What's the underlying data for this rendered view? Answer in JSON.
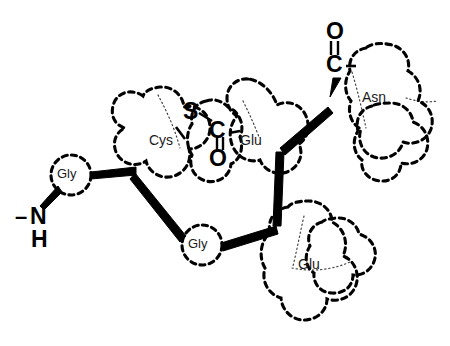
{
  "figure": {
    "kind": "chemical-structure-diagram",
    "background_color": "#ffffff",
    "ink_color": "#000000",
    "residue_outline_style": "dashed",
    "internal_partition_style": "dotted",
    "backbone_bond_style": "thick solid tapered"
  },
  "residues": [
    {
      "id": "gly-1",
      "label": "Gly",
      "shape": "circle",
      "label_x": 71,
      "label_y": 175,
      "font_size": 13
    },
    {
      "id": "cys",
      "label": "Cys",
      "shape": "lobed-envelope",
      "label_x": 168,
      "label_y": 142,
      "font_size": 13
    },
    {
      "id": "glu-upper",
      "label": "Glu",
      "shape": "lobed-envelope",
      "label_x": 254,
      "label_y": 142,
      "font_size": 13
    },
    {
      "id": "asn",
      "label": "Asn",
      "shape": "lobed-envelope",
      "label_x": 378,
      "label_y": 99,
      "font_size": 13
    },
    {
      "id": "gly-2",
      "label": "Gly",
      "shape": "circle",
      "label_x": 202,
      "label_y": 245,
      "font_size": 13
    },
    {
      "id": "glu-lower",
      "label": "Glu",
      "shape": "lobed-envelope",
      "label_x": 312,
      "label_y": 265,
      "font_size": 13
    }
  ],
  "atom_labels": [
    {
      "id": "n-terminus-n",
      "text": "N",
      "x": 36,
      "y": 218,
      "font_size": 22
    },
    {
      "id": "n-terminus-h",
      "text": "H",
      "x": 36,
      "y": 240,
      "font_size": 22
    },
    {
      "id": "n-terminus-dash",
      "text": "–",
      "x": 20,
      "y": 218,
      "font_size": 22
    },
    {
      "id": "cys-sulfur",
      "text": "S",
      "x": 188,
      "y": 113,
      "font_size": 22
    },
    {
      "id": "cys-carbonyl-c",
      "text": "C",
      "x": 214,
      "y": 131,
      "font_size": 22
    },
    {
      "id": "cys-carbonyl-o",
      "text": "O",
      "x": 214,
      "y": 158,
      "font_size": 22
    },
    {
      "id": "asn-carbonyl-o",
      "text": "O",
      "x": 331,
      "y": 33,
      "font_size": 22
    },
    {
      "id": "asn-carbonyl-c",
      "text": "C",
      "x": 331,
      "y": 64,
      "font_size": 22
    }
  ],
  "bond_marks": [
    {
      "id": "cys-c-o-double-bond",
      "type": "double",
      "orientation": "vertical"
    },
    {
      "id": "asn-c-o-double-bond",
      "type": "double",
      "orientation": "vertical"
    },
    {
      "id": "cys-s-to-c-bond",
      "type": "single",
      "orientation": "diagonal"
    },
    {
      "id": "cys-c-to-glu-bond",
      "type": "single",
      "orientation": "horizontal"
    },
    {
      "id": "asn-c-to-residue-bond",
      "type": "single",
      "orientation": "horizontal"
    },
    {
      "id": "cys-sidechain-stub",
      "type": "single",
      "orientation": "diagonal"
    }
  ],
  "backbone_bonds": [
    {
      "id": "bond-n-to-gly1",
      "from": "n-terminus",
      "to": "gly-1"
    },
    {
      "id": "bond-gly1-to-cys",
      "from": "gly-1",
      "to": "cys"
    },
    {
      "id": "bond-cys-to-gly2",
      "from": "cys",
      "to": "gly-2"
    },
    {
      "id": "bond-gly2-to-junction",
      "from": "gly-2",
      "to": "junction"
    },
    {
      "id": "bond-junction-to-glu",
      "from": "junction",
      "to": "glu-upper"
    },
    {
      "id": "bond-glu-to-asn",
      "from": "glu-upper",
      "to": "asn"
    }
  ]
}
